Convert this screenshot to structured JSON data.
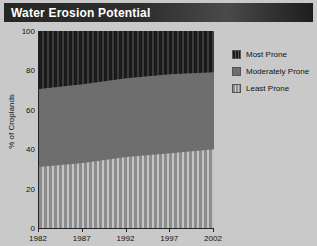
{
  "title": "Water Erosion Potential",
  "legend": {
    "items": [
      {
        "label": "Most Prone",
        "swatch": "dark-striped-swatch",
        "color": "#1a1a1a"
      },
      {
        "label": "Moderately Prone",
        "swatch": "gray-solid-swatch",
        "color": "#6e6e6e"
      },
      {
        "label": "Least Prone",
        "swatch": "light-striped-swatch",
        "color": "#c4c4c4"
      }
    ]
  },
  "chart_data": {
    "type": "area",
    "title": "Water Erosion Potential",
    "xlabel": "",
    "ylabel": "% of Croplands",
    "xlim": [
      1982,
      2002
    ],
    "ylim": [
      0,
      100
    ],
    "grid": false,
    "legend_position": "right",
    "stacked": true,
    "x": [
      1982,
      1987,
      1992,
      1997,
      2002
    ],
    "xticks": [
      "1982",
      "1987",
      "1992",
      "1997",
      "2002"
    ],
    "yticks": [
      "0",
      "20",
      "40",
      "60",
      "80",
      "100"
    ],
    "series": [
      {
        "name": "Least Prone",
        "values": [
          31,
          33,
          36,
          38,
          40
        ]
      },
      {
        "name": "Moderately Prone",
        "values": [
          39.5,
          40,
          40,
          40,
          39
        ]
      },
      {
        "name": "Most Prone",
        "values": [
          29.5,
          27,
          24,
          22,
          21
        ]
      }
    ],
    "cumulative_boundaries": {
      "least_top": [
        31,
        33,
        36,
        38,
        40
      ],
      "moderate_top": [
        70.5,
        73,
        76,
        78,
        79
      ]
    }
  },
  "axes": {
    "y_label": "% of Croplands",
    "y_ticks": [
      {
        "value": 100,
        "label": "100"
      },
      {
        "value": 80,
        "label": "80"
      },
      {
        "value": 60,
        "label": "60"
      },
      {
        "value": 40,
        "label": "40"
      },
      {
        "value": 20,
        "label": "20"
      },
      {
        "value": 0,
        "label": "0"
      }
    ],
    "x_ticks": [
      {
        "value": 1982,
        "label": "1982"
      },
      {
        "value": 1987,
        "label": "1987"
      },
      {
        "value": 1992,
        "label": "1992"
      },
      {
        "value": 1997,
        "label": "1997"
      },
      {
        "value": 2002,
        "label": "2002"
      }
    ]
  }
}
